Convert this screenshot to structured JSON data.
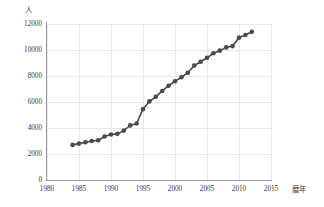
{
  "chart_data": {
    "type": "line",
    "title": "",
    "subtitle": "",
    "xlabel": "暦年",
    "ylabel": "人",
    "xlim": [
      1980,
      2015
    ],
    "ylim": [
      0,
      12000
    ],
    "grid": true,
    "legend": null,
    "marker": "filled-circle",
    "accent_color": "#4a4a4a",
    "grid_color": "#e8e8ec",
    "axis_color": "#9a9a9a",
    "xticks": [
      "1980",
      "1985",
      "1990",
      "1995",
      "2000",
      "2005",
      "2010",
      "2015"
    ],
    "yticks": [
      "0",
      "2000",
      "4000",
      "6000",
      "8000",
      "10000",
      "12000"
    ],
    "x": [
      1984,
      1985,
      1986,
      1987,
      1988,
      1989,
      1990,
      1991,
      1992,
      1993,
      1994,
      1995,
      1996,
      1997,
      1998,
      1999,
      2000,
      2001,
      2002,
      2003,
      2004,
      2005,
      2006,
      2007,
      2008,
      2009,
      2010,
      2011,
      2012
    ],
    "values": [
      2700,
      2800,
      2900,
      3000,
      3050,
      3350,
      3500,
      3550,
      3800,
      4200,
      4350,
      5450,
      6050,
      6400,
      6850,
      7250,
      7600,
      7900,
      8250,
      8800,
      9100,
      9400,
      9750,
      9950,
      10200,
      10300,
      10950,
      11150,
      11400
    ],
    "series_name": "人数"
  },
  "axis": {
    "y_unit_label": "人",
    "x_title_label": "暦年"
  }
}
